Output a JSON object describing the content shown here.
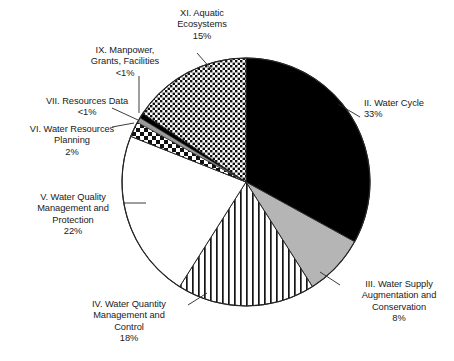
{
  "chart_data": {
    "type": "pie",
    "title": "",
    "subtitle": "",
    "xlabel": "",
    "ylabel": "",
    "legend_position": "callout-labels",
    "grid": false,
    "start_angle_deg": 0,
    "direction": "clockwise",
    "center": {
      "x": 246,
      "y": 182
    },
    "radius": 124,
    "units": "percent",
    "categories": [
      "II. Water Cycle",
      "III. Water Supply Augmentation and Conservation",
      "IV. Water Quantity Management and Control",
      "V. Water Quality Management and Protection",
      "VI. Water Resources Planning",
      "VII. Resources Data",
      "IX. Manpower, Grants, Facilities",
      "XI. Aquatic Ecosystems"
    ],
    "values": [
      33,
      8,
      18,
      22,
      2,
      0.6,
      0.6,
      15
    ],
    "value_labels": [
      "33%",
      "8%",
      "18%",
      "22%",
      "2%",
      "<1%",
      "<1%",
      "15%"
    ],
    "slices": [
      {
        "id": "water-cycle",
        "name": "II. Water Cycle",
        "value": 33,
        "value_label": "33%",
        "fill": "solid-black",
        "color": "#000000",
        "start_deg": 0,
        "sweep_deg": 118.8
      },
      {
        "id": "water-supply",
        "name": "III. Water Supply Augmentation and Conservation",
        "value": 8,
        "value_label": "8%",
        "fill": "solid-gray",
        "color": "#b5b5b5",
        "start_deg": 118.8,
        "sweep_deg": 28.8
      },
      {
        "id": "water-quantity",
        "name": "IV. Water Quantity Management and Control",
        "value": 18,
        "value_label": "18%",
        "fill": "vertical-stripes",
        "color": "#ffffff",
        "start_deg": 147.6,
        "sweep_deg": 64.8
      },
      {
        "id": "water-quality",
        "name": "V. Water Quality Management and Protection",
        "value": 22,
        "value_label": "22%",
        "fill": "solid-white",
        "color": "#ffffff",
        "start_deg": 212.4,
        "sweep_deg": 79.2
      },
      {
        "id": "water-resources-planning",
        "name": "VI. Water Resources Planning",
        "value": 2,
        "value_label": "2%",
        "fill": "checkerboard",
        "color": "#ffffff",
        "start_deg": 291.6,
        "sweep_deg": 7.2
      },
      {
        "id": "resources-data",
        "name": "VII. Resources Data",
        "value": 0.6,
        "value_label": "<1%",
        "fill": "solid-gray",
        "color": "#9a9a9a",
        "start_deg": 298.8,
        "sweep_deg": 2.4
      },
      {
        "id": "manpower-grants-facilities",
        "name": "IX. Manpower, Grants, Facilities",
        "value": 0.6,
        "value_label": "<1%",
        "fill": "solid-black",
        "color": "#000000",
        "start_deg": 301.2,
        "sweep_deg": 2.4
      },
      {
        "id": "aquatic-ecosystems",
        "name": "XI. Aquatic Ecosystems",
        "value": 15,
        "value_label": "15%",
        "fill": "dotted",
        "color": "#ffffff",
        "start_deg": 303.6,
        "sweep_deg": 56.4
      }
    ]
  },
  "labels": {
    "aquatic_ecosystems": "XI. Aquatic\nEcosystems\n15%",
    "manpower": "IX. Manpower,\nGrants, Facilities\n<1%",
    "resources_data": "VII. Resources Data\n<1%",
    "water_resources_planning": "VI. Water Resources\nPlanning\n2%",
    "water_quality": "V. Water Quality\nManagement and\nProtection\n22%",
    "water_quantity": "IV. Water Quantity\nManagement and\nControl\n18%",
    "water_cycle": "II. Water Cycle\n33%",
    "water_supply": "III. Water Supply\nAugmentation and\nConservation\n8%"
  },
  "colors": {
    "outline": "#262626",
    "black": "#000000",
    "gray": "#b5b5b5",
    "dark_gray": "#9a9a9a",
    "white": "#ffffff",
    "text": "#1a1a1a",
    "background": "#ffffff"
  }
}
